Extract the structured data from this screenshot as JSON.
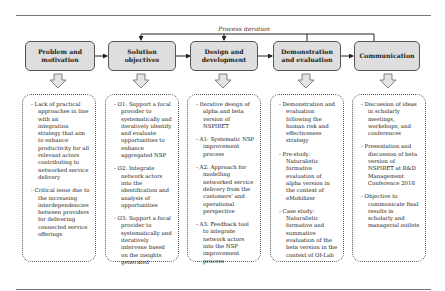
{
  "diagram": {
    "iteration_label": "Process iteration",
    "stages": [
      {
        "title": "Problem and motivation",
        "items": [
          "Lack of practical approaches in line with an integration strategy that aim to enhance productivity for all relevant actors contributing to networked service delivery",
          "Critical issue due to the increasing interdependencies between providers for delivering connected service offerings"
        ]
      },
      {
        "title": "Solution objectives",
        "items": [
          "O1: Support a focal provider to systematically and iteratively identify and evaluate opportunities to enhance aggregated NSP",
          "O2: Integrate network actors into the identification and analysis of opportunities",
          "O3: Support a focal provider to systematically and iteratively intervene based on the insights generated"
        ]
      },
      {
        "title": "Design and development",
        "items": [
          "Iterative design of alpha and beta version of NSPIRET",
          "A1: Systematic NSP improvement process",
          "A2: Approach for modelling networked service delivery from the customers' and operational perspective",
          "A3: Feedback tool to integrate network actors into the NSP improvement process"
        ]
      },
      {
        "title": "Demonstration and evaluation",
        "items": [
          "Demonstration and evaluation following the human risk and effectiveness strategy",
          "Pre-study: Naturalistic formative evaluation of alpha version in the context of eMobilizer",
          "Case study: Naturalistic formative and summative evaluation of the beta version in the context of OI-Lab"
        ]
      },
      {
        "title": "Communication",
        "items": [
          "Discussion of ideas in scholarly meetings, workshops, and conferences",
          "Presentation and discussion of beta version of NSPIRET at R&D Management Conference 2018",
          "Objective to communicate final results in scholarly and managerial outlets"
        ]
      }
    ]
  }
}
